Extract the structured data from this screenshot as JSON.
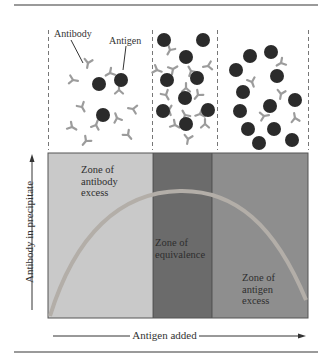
{
  "figure": {
    "top_labels": {
      "antibody": "Antibody",
      "antigen": "Antigen"
    },
    "zones": [
      {
        "id": "antibody-excess",
        "label": "Zone of\nantibody\nexcess",
        "color": "#c9c9c9"
      },
      {
        "id": "equivalence",
        "label": "Zone of\nequivalence",
        "color": "#6b6b6b"
      },
      {
        "id": "antigen-excess",
        "label": "Zone of\nantigen\nexcess",
        "color": "#8e8e8e"
      }
    ],
    "axes": {
      "y_label": "Antibody in precipitate",
      "x_label": "Antigen added"
    },
    "colors": {
      "antigen": "#2b2b2b",
      "antibody": "#9c9c9c",
      "curve": "#b3aea8",
      "rule": "#9a9a9a"
    }
  }
}
